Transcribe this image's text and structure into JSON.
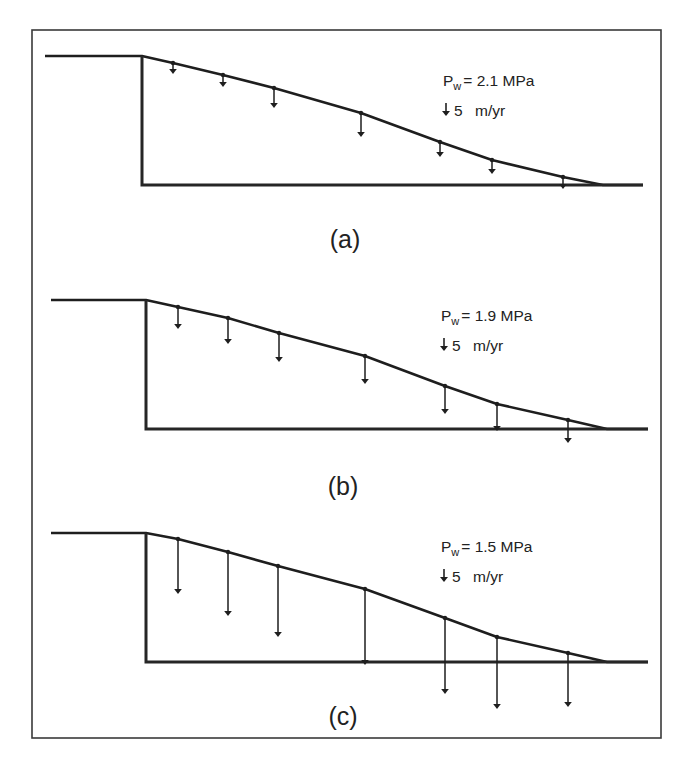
{
  "figure": {
    "width": 691,
    "height": 767,
    "frame": {
      "x": 32,
      "y": 30,
      "width": 629,
      "height": 708
    },
    "colors": {
      "ink": "#1e1e1e",
      "frame": "#3a3a3a",
      "background": "#ffffff"
    }
  },
  "legend_common": {
    "pressure_symbol": "P",
    "pressure_subscript": "w",
    "scale_arrow_icon": "down-arrow-icon",
    "scale_value": "5",
    "scale_unit": "m/yr"
  },
  "panels": [
    {
      "id": "a",
      "label": "(a)",
      "pressure_text": "= 2.1 MPa",
      "pressure_value_mpa": 2.1,
      "label_pos": {
        "x": 345,
        "y": 248
      },
      "legend_pos": {
        "x": 443,
        "y": 86
      },
      "surface": [
        [
          45,
          56
        ],
        [
          142,
          56
        ],
        [
          173,
          63
        ],
        [
          223,
          75
        ],
        [
          274,
          88
        ],
        [
          361,
          113
        ],
        [
          440,
          142
        ],
        [
          492,
          160
        ],
        [
          563,
          177
        ],
        [
          603,
          185
        ],
        [
          643,
          185
        ]
      ],
      "wall_x": 142,
      "base_y": 185,
      "arrows": [
        {
          "x": 173,
          "y0": 63,
          "y1": 74
        },
        {
          "x": 223,
          "y0": 75,
          "y1": 87
        },
        {
          "x": 274,
          "y0": 88,
          "y1": 108
        },
        {
          "x": 361,
          "y0": 113,
          "y1": 137
        },
        {
          "x": 440,
          "y0": 142,
          "y1": 157
        },
        {
          "x": 492,
          "y0": 160,
          "y1": 174
        },
        {
          "x": 563,
          "y0": 177,
          "y1": 189
        }
      ]
    },
    {
      "id": "b",
      "label": "(b)",
      "pressure_text": "= 1.9 MPa",
      "pressure_value_mpa": 1.9,
      "label_pos": {
        "x": 343,
        "y": 495
      },
      "legend_pos": {
        "x": 441,
        "y": 321
      },
      "surface": [
        [
          51,
          300
        ],
        [
          146,
          300
        ],
        [
          178,
          307
        ],
        [
          228,
          318
        ],
        [
          279,
          333
        ],
        [
          365,
          356
        ],
        [
          445,
          386
        ],
        [
          497,
          404
        ],
        [
          568,
          420
        ],
        [
          607,
          429
        ],
        [
          648,
          429
        ]
      ],
      "wall_x": 146,
      "base_y": 429,
      "arrows": [
        {
          "x": 178,
          "y0": 307,
          "y1": 329
        },
        {
          "x": 228,
          "y0": 318,
          "y1": 344
        },
        {
          "x": 279,
          "y0": 333,
          "y1": 362
        },
        {
          "x": 365,
          "y0": 356,
          "y1": 384
        },
        {
          "x": 445,
          "y0": 386,
          "y1": 414
        },
        {
          "x": 497,
          "y0": 404,
          "y1": 431
        },
        {
          "x": 568,
          "y0": 420,
          "y1": 443
        }
      ]
    },
    {
      "id": "c",
      "label": "(c)",
      "pressure_text": "= 1.5 MPa",
      "pressure_value_mpa": 1.5,
      "label_pos": {
        "x": 343,
        "y": 725
      },
      "legend_pos": {
        "x": 441,
        "y": 552
      },
      "surface": [
        [
          51,
          533
        ],
        [
          146,
          533
        ],
        [
          178,
          539
        ],
        [
          228,
          552
        ],
        [
          278,
          566
        ],
        [
          365,
          589
        ],
        [
          445,
          618
        ],
        [
          497,
          637
        ],
        [
          568,
          653
        ],
        [
          607,
          662
        ],
        [
          648,
          662
        ]
      ],
      "wall_x": 146,
      "base_y": 662,
      "arrows": [
        {
          "x": 178,
          "y0": 539,
          "y1": 594
        },
        {
          "x": 228,
          "y0": 552,
          "y1": 616
        },
        {
          "x": 278,
          "y0": 566,
          "y1": 637
        },
        {
          "x": 365,
          "y0": 589,
          "y1": 665
        },
        {
          "x": 445,
          "y0": 618,
          "y1": 694
        },
        {
          "x": 497,
          "y0": 637,
          "y1": 709
        },
        {
          "x": 568,
          "y0": 653,
          "y1": 707
        }
      ]
    }
  ]
}
